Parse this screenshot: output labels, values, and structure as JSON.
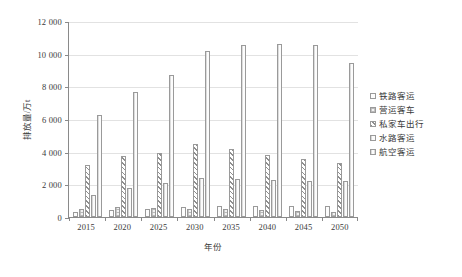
{
  "chart_data": {
    "type": "bar",
    "title": "",
    "xlabel": "年份",
    "ylabel": "排放量/万t",
    "categories": [
      "2015",
      "2020",
      "2025",
      "2030",
      "2035",
      "2040",
      "2045",
      "2050"
    ],
    "ylim": [
      0,
      12000
    ],
    "yticks": [
      "0",
      "2 000",
      "4 000",
      "6 000",
      "8 000",
      "10 000",
      "12 000"
    ],
    "ytick_values": [
      0,
      2000,
      4000,
      6000,
      8000,
      10000,
      12000
    ],
    "grid": true,
    "legend_position": "right",
    "series": [
      {
        "name": "铁路客运",
        "values": [
          330,
          430,
          520,
          600,
          650,
          690,
          700,
          700
        ]
      },
      {
        "name": "营运客车",
        "values": [
          520,
          600,
          560,
          520,
          480,
          430,
          380,
          330
        ]
      },
      {
        "name": "私家车出行",
        "values": [
          3200,
          3750,
          3900,
          4450,
          4150,
          3800,
          3550,
          3300
        ]
      },
      {
        "name": "水路客运",
        "values": [
          1350,
          1800,
          2100,
          2400,
          2330,
          2280,
          2230,
          2180
        ]
      },
      {
        "name": "航空客运",
        "values": [
          6250,
          7650,
          8700,
          10150,
          10550,
          10600,
          10550,
          9400
        ]
      }
    ]
  },
  "legend": {
    "items": [
      {
        "label": "铁路客运",
        "pattern": "plain"
      },
      {
        "label": "营运客车",
        "pattern": "check"
      },
      {
        "label": "私家车出行",
        "pattern": "hatch"
      },
      {
        "label": "水路客运",
        "pattern": "vlight"
      },
      {
        "label": "航空客运",
        "pattern": "vline"
      }
    ]
  }
}
